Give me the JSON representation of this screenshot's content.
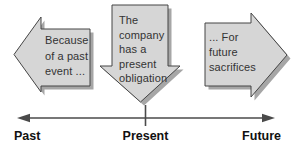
{
  "diagram": {
    "arrows": {
      "left": {
        "direction": "left",
        "lines": [
          "Because",
          "of a past",
          "event ..."
        ]
      },
      "center": {
        "direction": "down",
        "lines": [
          "The",
          "company",
          "has a",
          "present",
          "obligation"
        ]
      },
      "right": {
        "direction": "right",
        "lines": [
          "... For",
          "future",
          "sacrifices"
        ]
      }
    },
    "timeline": {
      "labels": {
        "past": "Past",
        "present": "Present",
        "future": "Future"
      }
    },
    "colors": {
      "arrow_fill": "#d6d6d6",
      "arrow_outline": "#454545",
      "arrow_shadow": "#a6a6a6",
      "arrow_text": "#333333",
      "timeline_line": "#4a4a4a",
      "label_text": "#111111",
      "background": "#ffffff"
    }
  }
}
